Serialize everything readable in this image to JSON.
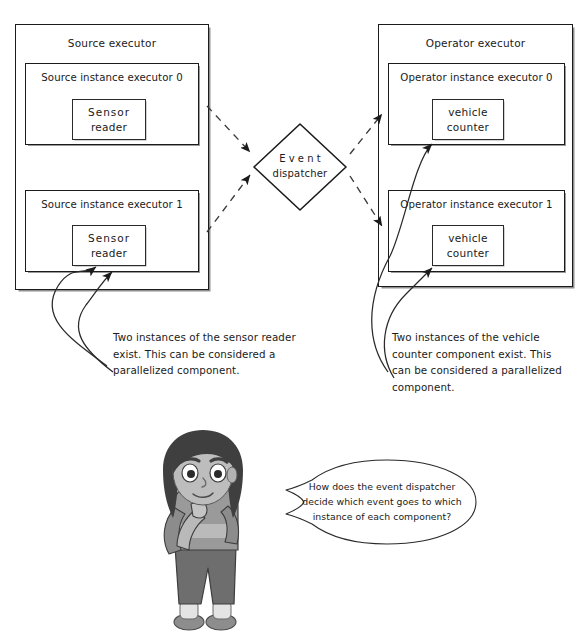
{
  "diagram": {
    "title_fragment": "",
    "left_container": {
      "title": "Source executor",
      "instances": [
        {
          "title": "Source instance executor 0",
          "component_line1": "Sensor",
          "component_line2": "reader"
        },
        {
          "title": "Source instance executor 1",
          "component_line1": "Sensor",
          "component_line2": "reader"
        }
      ]
    },
    "right_container": {
      "title": "Operator executor",
      "instances": [
        {
          "title": "Operator instance executor 0",
          "component_line1": "vehicle",
          "component_line2": "counter"
        },
        {
          "title": "Operator instance executor 1",
          "component_line1": "vehicle",
          "component_line2": "counter"
        }
      ]
    },
    "dispatcher": {
      "line1": "Event",
      "line2": "dispatcher"
    },
    "captions": {
      "left": "Two instances of the sensor reader exist. This can be considered a parallelized component.",
      "right": "Two instances of the vehicle counter component exist. This can be considered a parallelized component."
    },
    "speech_bubble": {
      "text": "How does the event dispatcher decide which event goes to which instance of each component?"
    },
    "colors": {
      "stroke": "#1b1b1b",
      "shadow": "#9a9a9a",
      "background": "#ffffff",
      "hair": "#3f3f3f",
      "skin": "#b9b9b9",
      "shirt": "#8c8c8c",
      "pants": "#6e6e6e"
    }
  }
}
